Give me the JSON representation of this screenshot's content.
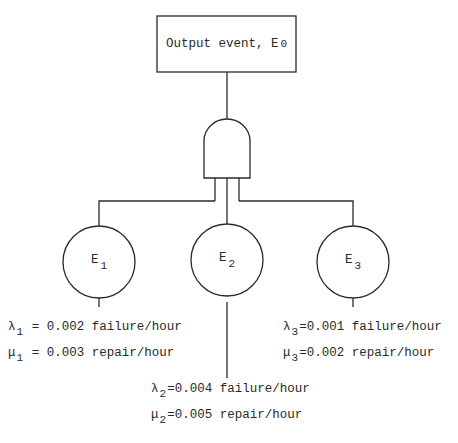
{
  "diagram": {
    "type": "fault-tree",
    "top_event": {
      "label": "Output event, E",
      "subscript": "0"
    },
    "gate": {
      "type": "AND"
    },
    "basic_events": [
      {
        "label": "E",
        "subscript": "1",
        "failure": {
          "symbol": "λ",
          "sub": "1",
          "text": " = 0.002 failure/hour"
        },
        "repair": {
          "symbol": "μ",
          "sub": "1",
          "text": " = 0.003 repair/hour"
        }
      },
      {
        "label": "E",
        "subscript": "2",
        "failure": {
          "symbol": "λ",
          "sub": "2",
          "text": "=0.004 failure/hour"
        },
        "repair": {
          "symbol": "μ",
          "sub": "2",
          "text": "=0.005 repair/hour"
        }
      },
      {
        "label": "E",
        "subscript": "3",
        "failure": {
          "symbol": "λ",
          "sub": "3",
          "text": "=0.001 failure/hour"
        },
        "repair": {
          "symbol": "μ",
          "sub": "3",
          "text": "=0.002 repair/hour"
        }
      }
    ],
    "colors": {
      "stroke": "#2a2a2a",
      "background": "#ffffff"
    }
  }
}
